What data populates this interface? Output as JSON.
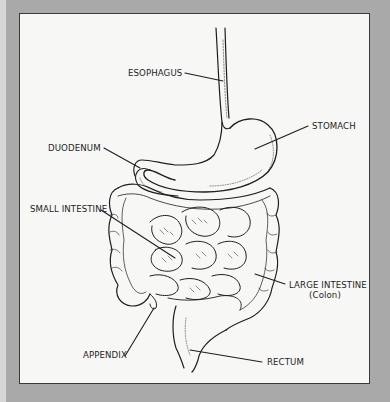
{
  "diagram": {
    "type": "anatomical-illustration",
    "colors": {
      "background": "#a9a9a9",
      "panel": "#f7f7f5",
      "ink": "#1e1e1e"
    },
    "labels": {
      "esophagus": "ESOPHAGUS",
      "stomach": "STOMACH",
      "duodenum": "DUODENUM",
      "small_intestine": "SMALL INTESTINE",
      "large_intestine": "LARGE INTESTINE",
      "large_intestine_sub": "(Colon)",
      "appendix": "APPENDIX",
      "rectum": "RECTUM"
    }
  }
}
